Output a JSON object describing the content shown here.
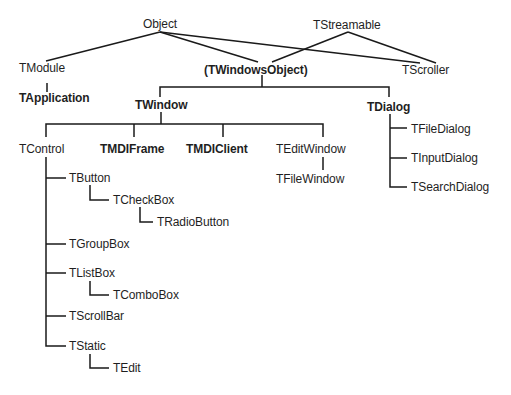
{
  "diagram": {
    "type": "class-hierarchy",
    "nodes": {
      "object": {
        "label": "Object",
        "bold": false
      },
      "tstreamable": {
        "label": "TStreamable",
        "bold": false
      },
      "tmodule": {
        "label": "TModule",
        "bold": false
      },
      "twindowsobject": {
        "label": "(TWindowsObject)",
        "bold": true
      },
      "tscroller": {
        "label": "TScroller",
        "bold": false
      },
      "tapplication": {
        "label": "TApplication",
        "bold": true
      },
      "twindow": {
        "label": "TWindow",
        "bold": true
      },
      "tdialog": {
        "label": "TDialog",
        "bold": true
      },
      "tcontrol": {
        "label": "TControl",
        "bold": false
      },
      "tmdiframe": {
        "label": "TMDIFrame",
        "bold": true
      },
      "tmdiclient": {
        "label": "TMDIClient",
        "bold": true
      },
      "teditwindow": {
        "label": "TEditWindow",
        "bold": false
      },
      "tfilewindow": {
        "label": "TFileWindow",
        "bold": false
      },
      "tfiledialog": {
        "label": "TFileDialog",
        "bold": false
      },
      "tinputdialog": {
        "label": "TInputDialog",
        "bold": false
      },
      "tsearchdialog": {
        "label": "TSearchDialog",
        "bold": false
      },
      "tbutton": {
        "label": "TButton",
        "bold": false
      },
      "tcheckbox": {
        "label": "TCheckBox",
        "bold": false
      },
      "tradiobutton": {
        "label": "TRadioButton",
        "bold": false
      },
      "tgroupbox": {
        "label": "TGroupBox",
        "bold": false
      },
      "tlistbox": {
        "label": "TListBox",
        "bold": false
      },
      "tcombobox": {
        "label": "TComboBox",
        "bold": false
      },
      "tscrollbar": {
        "label": "TScrollBar",
        "bold": false
      },
      "tstatic": {
        "label": "TStatic",
        "bold": false
      },
      "tedit": {
        "label": "TEdit",
        "bold": false
      }
    },
    "edges": [
      [
        "object",
        "tmodule"
      ],
      [
        "object",
        "twindowsobject"
      ],
      [
        "object",
        "tscroller"
      ],
      [
        "tstreamable",
        "twindowsobject"
      ],
      [
        "tstreamable",
        "tscroller"
      ],
      [
        "tmodule",
        "tapplication"
      ],
      [
        "twindowsobject",
        "twindow"
      ],
      [
        "twindowsobject",
        "tdialog"
      ],
      [
        "twindow",
        "tcontrol"
      ],
      [
        "twindow",
        "tmdiframe"
      ],
      [
        "twindow",
        "tmdiclient"
      ],
      [
        "twindow",
        "teditwindow"
      ],
      [
        "teditwindow",
        "tfilewindow"
      ],
      [
        "tdialog",
        "tfiledialog"
      ],
      [
        "tdialog",
        "tinputdialog"
      ],
      [
        "tdialog",
        "tsearchdialog"
      ],
      [
        "tcontrol",
        "tbutton"
      ],
      [
        "tbutton",
        "tcheckbox"
      ],
      [
        "tcheckbox",
        "tradiobutton"
      ],
      [
        "tcontrol",
        "tgroupbox"
      ],
      [
        "tcontrol",
        "tlistbox"
      ],
      [
        "tlistbox",
        "tcombobox"
      ],
      [
        "tcontrol",
        "tscrollbar"
      ],
      [
        "tcontrol",
        "tstatic"
      ],
      [
        "tstatic",
        "tedit"
      ]
    ]
  }
}
